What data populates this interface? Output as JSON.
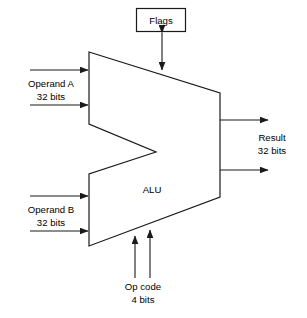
{
  "diagram": {
    "type": "block-diagram",
    "unit_label": "ALU",
    "flags_box": {
      "label": "Flags",
      "connection": "bidirectional",
      "connects_to": "alu-top-edge"
    },
    "inputs": [
      {
        "id": "operand-a",
        "name_line1": "Operand A",
        "name_line2": "32 bits",
        "width_bits": 4,
        "side": "left",
        "arrow_count": 2
      },
      {
        "id": "operand-b",
        "name_line1": "Operand B",
        "name_line2": "32 bits",
        "width_bits": 32,
        "side": "left",
        "arrow_count": 2
      },
      {
        "id": "op-code",
        "name_line1": "Op code",
        "name_line2": "4 bits",
        "width_bits": 4,
        "side": "bottom",
        "arrow_count": 2
      }
    ],
    "outputs": [
      {
        "id": "result",
        "name_line1": "Result",
        "name_line2": "32 bits",
        "width_bits": 32,
        "side": "right",
        "arrow_count": 2
      }
    ],
    "colors": {
      "stroke": "#1a1a1a",
      "fill": "#ffffff",
      "text": "#000000",
      "background": "#ffffff"
    }
  }
}
